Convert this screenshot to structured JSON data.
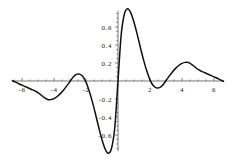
{
  "chart_data": {
    "type": "line",
    "title": "",
    "subtitle": "",
    "xlabel": "",
    "ylabel": "",
    "xlim": [
      -6.6,
      6.6
    ],
    "ylim": [
      -0.78,
      0.78
    ],
    "grid": false,
    "legend": null,
    "axes_style": "centered-cross",
    "line_color": "#111111",
    "axis_color": "#555555",
    "background": "#ffffff",
    "xticks": [
      -6,
      -4,
      -2,
      2,
      4,
      6
    ],
    "xtick_labels": [
      "-6",
      "-4",
      "-2",
      "2",
      "4",
      "6"
    ],
    "yticks": [
      -0.6,
      -0.4,
      -0.2,
      0.2,
      0.4,
      0.6
    ],
    "ytick_labels": [
      "-0.6",
      "-0.4",
      "-0.2",
      "0.2",
      "0.4",
      "0.6"
    ],
    "minor_tick_step_x": 0.5,
    "minor_tick_step_y": 0.05,
    "annotations": [],
    "series": [
      {
        "name": "f(x)",
        "description": "odd damped oscillation, sinc-derivative like",
        "x": [
          -6.6,
          -6.4,
          -6.2,
          -6.0,
          -5.8,
          -5.6,
          -5.4,
          -5.2,
          -5.0,
          -4.8,
          -4.6,
          -4.4,
          -4.2,
          -4.0,
          -3.8,
          -3.6,
          -3.4,
          -3.2,
          -3.0,
          -2.8,
          -2.6,
          -2.4,
          -2.2,
          -2.0,
          -1.8,
          -1.6,
          -1.4,
          -1.2,
          -1.0,
          -0.8,
          -0.6,
          -0.4,
          -0.2,
          0.0,
          0.2,
          0.4,
          0.6,
          0.8,
          1.0,
          1.2,
          1.4,
          1.6,
          1.8,
          2.0,
          2.2,
          2.4,
          2.6,
          2.8,
          3.0,
          3.2,
          3.4,
          3.6,
          3.8,
          4.0,
          4.2,
          4.4,
          4.6,
          4.8,
          5.0,
          5.2,
          5.4,
          5.6,
          5.8,
          6.0,
          6.2,
          6.4,
          6.6
        ],
        "y": [
          0.003,
          -0.013,
          -0.03,
          -0.046,
          -0.062,
          -0.078,
          -0.094,
          -0.11,
          -0.128,
          -0.157,
          -0.186,
          -0.205,
          -0.207,
          -0.196,
          -0.172,
          -0.14,
          -0.1,
          -0.054,
          -0.005,
          0.045,
          0.074,
          0.076,
          0.05,
          -0.013,
          -0.11,
          -0.232,
          -0.372,
          -0.518,
          -0.653,
          -0.757,
          -0.804,
          -0.745,
          -0.515,
          0.0,
          0.515,
          0.745,
          0.804,
          0.757,
          0.653,
          0.518,
          0.372,
          0.232,
          0.11,
          0.013,
          -0.05,
          -0.076,
          -0.074,
          -0.045,
          0.005,
          0.054,
          0.1,
          0.14,
          0.172,
          0.196,
          0.207,
          0.205,
          0.186,
          0.157,
          0.128,
          0.11,
          0.094,
          0.078,
          0.062,
          0.046,
          0.03,
          0.013,
          -0.003
        ]
      }
    ],
    "features": {
      "global_max": {
        "x": 1.35,
        "y": 0.72
      },
      "global_min": {
        "x": -1.35,
        "y": -0.72
      },
      "secondary_max": {
        "x": 4.6,
        "y": 0.21
      },
      "secondary_min": {
        "x": -4.6,
        "y": -0.21
      },
      "zero_crossings": [
        -6.5,
        -3.1,
        0.0,
        3.1,
        6.5
      ]
    }
  }
}
